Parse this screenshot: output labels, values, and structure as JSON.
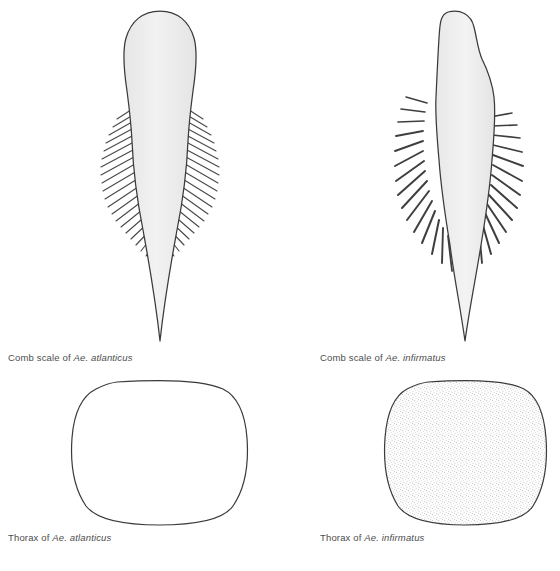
{
  "figure": {
    "background_color": "#ffffff",
    "outline_color": "#3a3a3a",
    "scale_fill_color": "#eeeeee",
    "stipple_color": "#8c8c8c",
    "caption_color": "#4d4d4d"
  },
  "panels": [
    {
      "id": "comb-atlanticus",
      "subject": "comb scale",
      "caption_prefix": "Comb scale of ",
      "caption_genus": "Ae. ",
      "caption_species": "atlanticus",
      "caption_full": "Comb scale of Ae. atlanticus",
      "shape": "broad oval comb scale with long apical spine and dense fine lateral fringe",
      "fringe_style": "dense fine hairs",
      "fringe_count_per_side": 22,
      "fill": "#eeeeee"
    },
    {
      "id": "comb-infirmatus",
      "subject": "comb scale",
      "caption_prefix": "Comb scale of ",
      "caption_genus": "Ae. ",
      "caption_species": "infirmatus",
      "caption_full": "Comb scale of Ae. infirmatus",
      "shape": "narrow asymmetric comb scale with long apical spine and coarse widely spaced lateral spines",
      "fringe_style": "coarse stout spines",
      "fringe_count_per_side": 15,
      "fill": "#eeeeee"
    },
    {
      "id": "thorax-atlanticus",
      "subject": "thorax",
      "caption_prefix": "Thorax of ",
      "caption_genus": "Ae. ",
      "caption_species": "atlanticus",
      "caption_full": "Thorax of Ae. atlanticus",
      "shape": "rounded square outline, unmarked interior",
      "fill": "#ffffff",
      "texture": "none"
    },
    {
      "id": "thorax-infirmatus",
      "subject": "thorax",
      "caption_prefix": "Thorax of ",
      "caption_genus": "Ae. ",
      "caption_species": "infirmatus",
      "caption_full": "Thorax of Ae. infirmatus",
      "shape": "rounded square outline, finely stippled interior",
      "fill": "#fbfbfb",
      "texture": "stipple"
    }
  ]
}
